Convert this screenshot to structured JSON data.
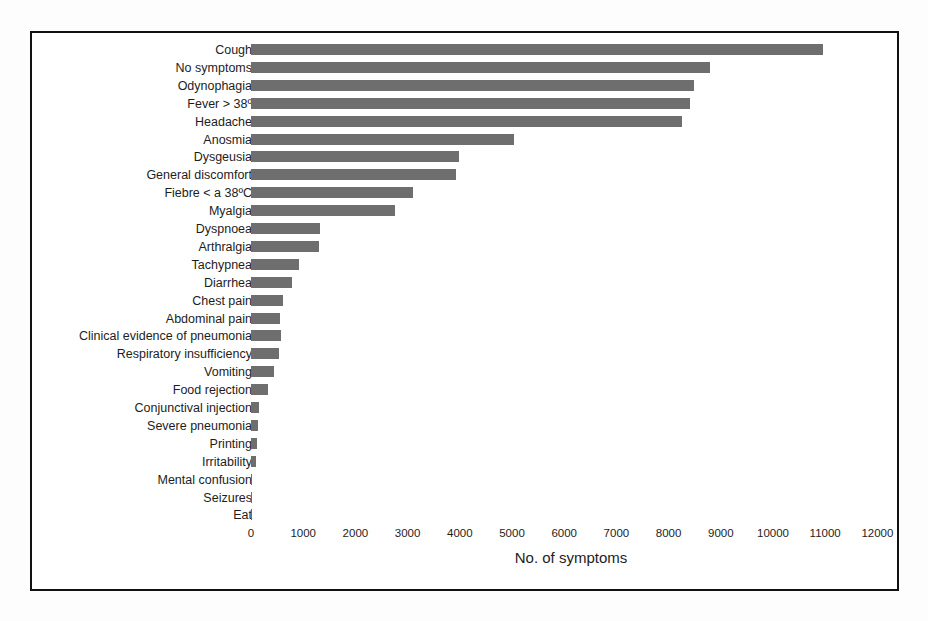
{
  "figure": {
    "frame_color": "#111111",
    "bar_color": "#6e6e6e",
    "background": "#ffffff"
  },
  "chart_data": {
    "type": "bar",
    "orientation": "horizontal",
    "title": "",
    "xlabel": "No. of symptoms",
    "ylabel": "",
    "xlim": [
      0,
      12000
    ],
    "xticks": [
      0,
      1000,
      2000,
      3000,
      4000,
      5000,
      6000,
      7000,
      8000,
      9000,
      10000,
      11000,
      12000
    ],
    "xtick_labels": [
      "0",
      "1000",
      "2000",
      "3000",
      "4000",
      "5000",
      "6000",
      "7000",
      "8000",
      "9000",
      "10000",
      "11000",
      "12000"
    ],
    "grid": false,
    "legend": "none",
    "categories": [
      "Cough",
      "No symptoms",
      "Odynophagia",
      "Fever > 38º",
      "Headache",
      "Anosmia",
      "Dysgeusia",
      "General discomfort",
      "Fiebre < a 38ºC",
      "Myalgia",
      "Dyspnoea",
      "Arthralgia",
      "Tachypnea",
      "Diarrhea",
      "Chest pain",
      "Abdominal pain",
      "Clinical evidence of pneumonia",
      "Respiratory insufficiency",
      "Vomiting",
      "Food rejection",
      "Conjunctival injection",
      "Severe pneumonia",
      "Printing",
      "Irritability",
      "Mental confusion",
      "Seizures",
      "Eat"
    ],
    "values": [
      10950,
      8800,
      8490,
      8410,
      8260,
      5040,
      3990,
      3920,
      3100,
      2760,
      1330,
      1300,
      920,
      790,
      610,
      555,
      575,
      535,
      440,
      325,
      155,
      135,
      115,
      95,
      25,
      8,
      5
    ]
  }
}
